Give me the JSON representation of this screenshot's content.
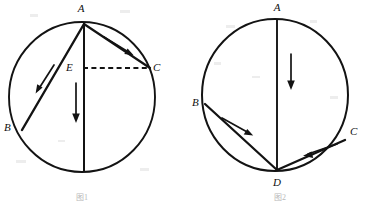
{
  "page": {
    "background_color": "#ffffff",
    "ink_color": "#131313",
    "width": 369,
    "height": 201
  },
  "figures": [
    {
      "id": "figure-left",
      "name": "left-circle-diagram",
      "caption": "图1 ",
      "circle": {
        "cx": 82,
        "cy": 97,
        "r": 73
      },
      "points": [
        {
          "id": "A",
          "label": "A",
          "label_x": 81,
          "label_y": 12,
          "x": 84,
          "y": 24
        },
        {
          "id": "B",
          "label": "B",
          "label_x": 4,
          "label_y": 131,
          "x": 22,
          "y": 130
        },
        {
          "id": "C",
          "label": "C",
          "label_x": 153,
          "label_y": 71,
          "x": 150,
          "y": 68
        },
        {
          "id": "E",
          "label": "E",
          "label_x": 66,
          "label_y": 71,
          "x": 84,
          "y": 68
        },
        {
          "id": "F",
          "label": "",
          "label_x": 0,
          "label_y": 0,
          "x": 84,
          "y": 170
        }
      ],
      "segments": [
        {
          "from": "A",
          "to": "B",
          "style": "solid"
        },
        {
          "from": "A",
          "to": "C",
          "style": "solid"
        },
        {
          "from": "A",
          "to": "F",
          "style": "solid"
        },
        {
          "from": "E",
          "to": "C",
          "style": "dashed"
        }
      ],
      "arrows": [
        {
          "name": "arrow-along-AC",
          "x1": 105,
          "x2": 133,
          "y1": 38,
          "y2": 55,
          "direction": "down-right"
        },
        {
          "name": "arrow-along-AB",
          "x1": 53,
          "x2": 36,
          "y1": 66,
          "y2": 92,
          "direction": "down-left"
        },
        {
          "name": "arrow-vertical-down",
          "x1": 76,
          "x2": 76,
          "y1": 84,
          "y2": 122,
          "direction": "down"
        }
      ]
    },
    {
      "id": "figure-right",
      "name": "right-circle-diagram",
      "caption": "图2 ",
      "circle": {
        "cx": 275,
        "cy": 95,
        "r": 74
      },
      "points": [
        {
          "id": "A",
          "label": "A",
          "label_x": 274,
          "label_y": 11,
          "x": 277,
          "y": 22
        },
        {
          "id": "B",
          "label": "B",
          "label_x": 192,
          "label_y": 106,
          "x": 205,
          "y": 104
        },
        {
          "id": "C",
          "label": "C",
          "label_x": 350,
          "label_y": 135,
          "x": 345,
          "y": 140
        },
        {
          "id": "D",
          "label": "D",
          "label_x": 274,
          "label_y": 186,
          "x": 277,
          "y": 170
        }
      ],
      "segments": [
        {
          "from": "A",
          "to": "D",
          "style": "solid"
        },
        {
          "from": "B",
          "to": "D",
          "style": "solid"
        },
        {
          "from": "C",
          "to": "D",
          "style": "solid"
        }
      ],
      "arrows": [
        {
          "name": "arrow-vertical-down",
          "x1": 291,
          "x2": 291,
          "y1": 55,
          "y2": 90,
          "direction": "down"
        },
        {
          "name": "arrow-along-BD",
          "x1": 221,
          "x2": 253,
          "y1": 117,
          "y2": 136,
          "direction": "down-right"
        },
        {
          "name": "arrow-along-CD",
          "x1": 337,
          "x2": 303,
          "y1": 145,
          "y2": 156,
          "direction": "down-left"
        }
      ]
    }
  ]
}
